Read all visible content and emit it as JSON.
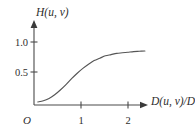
{
  "figure": {
    "background_color": "#ffffff",
    "axis_color": "#4a4a4a",
    "curve_color": "#555555",
    "text_color": "#2e2e2e"
  },
  "labels": {
    "y_axis_label": "H(u, v)",
    "y_axis_label_main": "H",
    "y_axis_label_args": "(u, v)",
    "x_axis_label": "D(u, v)/D",
    "x_axis_label_main": "D",
    "x_axis_label_args": "(u, v)/",
    "x_axis_label_denom": "D",
    "x_axis_label_subscript": "0",
    "origin_label": "O"
  },
  "axes": {
    "y_ticks": [
      {
        "label": "1.0",
        "value": 1.0
      },
      {
        "label": "0.5",
        "value": 0.5
      }
    ],
    "x_ticks": [
      {
        "label": "1",
        "value": 1
      },
      {
        "label": "2",
        "value": 2
      }
    ],
    "xlim": [
      0,
      2.45
    ],
    "ylim": [
      0,
      1.12
    ],
    "grid": false
  },
  "chart_data": {
    "type": "line",
    "title": "",
    "subtitle": "",
    "xlabel": "D(u, v)/D₀",
    "ylabel": "H(u, v)",
    "xlim": [
      0,
      2.45
    ],
    "ylim": [
      0,
      1.12
    ],
    "grid": false,
    "legend": null,
    "x_ticks": [
      1,
      2
    ],
    "x_tick_labels": [
      "1",
      "2"
    ],
    "y_ticks": [
      0.5,
      1.0
    ],
    "y_tick_labels": [
      "0.5",
      "1.0"
    ],
    "series": [
      {
        "name": "H(u, v)",
        "color": "#555555",
        "x": [
          0.08,
          0.2,
          0.32,
          0.44,
          0.56,
          0.68,
          0.8,
          0.92,
          1.04,
          1.16,
          1.28,
          1.4,
          1.52,
          1.64,
          1.76,
          1.88,
          2.0,
          2.12,
          2.24,
          2.36
        ],
        "y": [
          0.0,
          0.02,
          0.06,
          0.12,
          0.2,
          0.29,
          0.39,
          0.48,
          0.56,
          0.63,
          0.69,
          0.73,
          0.77,
          0.79,
          0.81,
          0.82,
          0.83,
          0.84,
          0.845,
          0.85
        ]
      }
    ],
    "annotations": [
      {
        "text": "O",
        "note": "origin marker below axis intersection"
      }
    ]
  }
}
